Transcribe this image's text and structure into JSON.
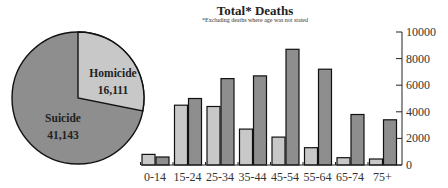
{
  "chart_data": [
    {
      "type": "pie",
      "title": "",
      "slices": [
        {
          "label": "Homicide",
          "value": 16111,
          "display": "16,111",
          "color": "#c8c8c8"
        },
        {
          "label": "Suicide",
          "value": 41143,
          "display": "41,143",
          "color": "#8e8e8e"
        }
      ]
    },
    {
      "type": "bar",
      "title": "Total* Deaths",
      "subtitle": "*Excluding deaths where age was not stated",
      "xlabel": "",
      "ylabel": "",
      "categories": [
        "0-14",
        "15-24",
        "25-34",
        "35-44",
        "45-54",
        "55-64",
        "65-74",
        "75+"
      ],
      "series": [
        {
          "name": "Homicide",
          "color": "#c8c8c8",
          "values": [
            800,
            4500,
            4400,
            2700,
            2100,
            1300,
            550,
            450
          ]
        },
        {
          "name": "Suicide",
          "color": "#8e8e8e",
          "values": [
            600,
            5000,
            6500,
            6700,
            8700,
            7200,
            3800,
            3400
          ]
        }
      ],
      "ylim": [
        0,
        10000
      ],
      "yticks": [
        0,
        2000,
        4000,
        6000,
        8000,
        10000
      ],
      "y_axis_position": "right",
      "grid": false,
      "legend": "none"
    }
  ],
  "header": {
    "title": "Total* Deaths",
    "subtitle": "*Excluding deaths where age was not stated"
  },
  "pie": {
    "homicide_label": "Homicide",
    "homicide_value": "16,111",
    "suicide_label": "Suicide",
    "suicide_value": "41,143"
  }
}
